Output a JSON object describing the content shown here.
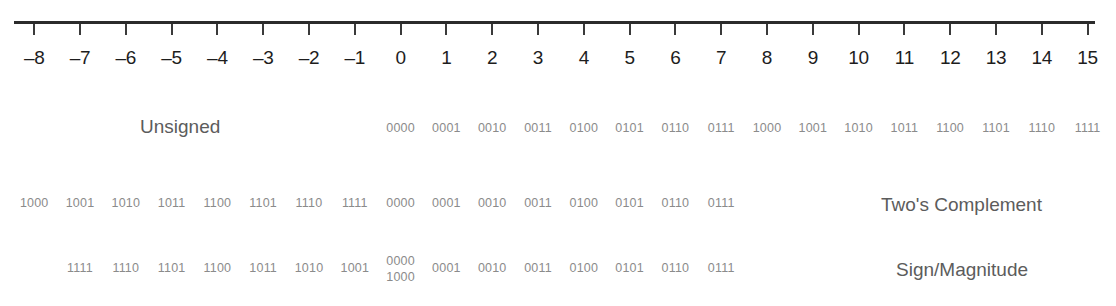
{
  "chart_data": {
    "type": "table",
    "title": "",
    "xlabel": "",
    "ylabel": "",
    "axis": {
      "min": -8,
      "max": 15,
      "tick_step": 1,
      "tick_labels": [
        "–8",
        "–7",
        "–6",
        "–5",
        "–4",
        "–3",
        "–2",
        "–1",
        "0",
        "1",
        "2",
        "3",
        "4",
        "5",
        "6",
        "7",
        "8",
        "9",
        "10",
        "11",
        "12",
        "13",
        "14",
        "15"
      ],
      "tick_values": [
        -8,
        -7,
        -6,
        -5,
        -4,
        -3,
        -2,
        -1,
        0,
        1,
        2,
        3,
        4,
        5,
        6,
        7,
        8,
        9,
        10,
        11,
        12,
        13,
        14,
        15
      ],
      "grid": false,
      "line_color": "#2b2b2b"
    },
    "rows": [
      {
        "name": "Unsigned",
        "label": "Unsigned",
        "label_side": "left",
        "entries": [
          {
            "value": 0,
            "code": "0000"
          },
          {
            "value": 1,
            "code": "0001"
          },
          {
            "value": 2,
            "code": "0010"
          },
          {
            "value": 3,
            "code": "0011"
          },
          {
            "value": 4,
            "code": "0100"
          },
          {
            "value": 5,
            "code": "0101"
          },
          {
            "value": 6,
            "code": "0110"
          },
          {
            "value": 7,
            "code": "0111"
          },
          {
            "value": 8,
            "code": "1000"
          },
          {
            "value": 9,
            "code": "1001"
          },
          {
            "value": 10,
            "code": "1010"
          },
          {
            "value": 11,
            "code": "1011"
          },
          {
            "value": 12,
            "code": "1100"
          },
          {
            "value": 13,
            "code": "1101"
          },
          {
            "value": 14,
            "code": "1110"
          },
          {
            "value": 15,
            "code": "1111"
          }
        ]
      },
      {
        "name": "Two's Complement",
        "label": "Two's Complement",
        "label_side": "right",
        "entries": [
          {
            "value": -8,
            "code": "1000"
          },
          {
            "value": -7,
            "code": "1001"
          },
          {
            "value": -6,
            "code": "1010"
          },
          {
            "value": -5,
            "code": "1011"
          },
          {
            "value": -4,
            "code": "1100"
          },
          {
            "value": -3,
            "code": "1101"
          },
          {
            "value": -2,
            "code": "1110"
          },
          {
            "value": -1,
            "code": "1111"
          },
          {
            "value": 0,
            "code": "0000"
          },
          {
            "value": 1,
            "code": "0001"
          },
          {
            "value": 2,
            "code": "0010"
          },
          {
            "value": 3,
            "code": "0011"
          },
          {
            "value": 4,
            "code": "0100"
          },
          {
            "value": 5,
            "code": "0101"
          },
          {
            "value": 6,
            "code": "0110"
          },
          {
            "value": 7,
            "code": "0111"
          }
        ]
      },
      {
        "name": "Sign/Magnitude",
        "label": "Sign/Magnitude",
        "label_side": "right",
        "entries": [
          {
            "value": -7,
            "code": "1111"
          },
          {
            "value": -6,
            "code": "1110"
          },
          {
            "value": -5,
            "code": "1101"
          },
          {
            "value": -4,
            "code": "1100"
          },
          {
            "value": -3,
            "code": "1011"
          },
          {
            "value": -2,
            "code": "1010"
          },
          {
            "value": -1,
            "code": "1001"
          },
          {
            "value": 0,
            "code": "0000",
            "code2": "1000"
          },
          {
            "value": 1,
            "code": "0001"
          },
          {
            "value": 2,
            "code": "0010"
          },
          {
            "value": 3,
            "code": "0011"
          },
          {
            "value": 4,
            "code": "0100"
          },
          {
            "value": 5,
            "code": "0101"
          },
          {
            "value": 6,
            "code": "0110"
          },
          {
            "value": 7,
            "code": "0111"
          }
        ]
      }
    ]
  },
  "colors": {
    "axis": "#2b2b2b",
    "axis_label": "#1d1d1d",
    "code_text": "#8b8b8b",
    "row_title": "#5c5c5c",
    "background": "#ffffff"
  }
}
